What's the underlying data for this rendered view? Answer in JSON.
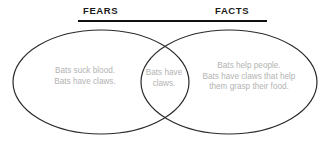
{
  "figure": {
    "name": "fears-vs-facts-venn-diagram",
    "background_color": "#ffffff"
  },
  "header": {
    "left_label": "FEARS",
    "right_label": "FACTS",
    "rule_color": "#111111",
    "label_color": "#1a1a1a"
  },
  "venn": {
    "outline_color": "#2b2b2b",
    "fill_color": "none",
    "stroke_width": 1.2,
    "left_circle": {
      "label": "FEARS",
      "text": "Bats suck blood.\nBats have claws."
    },
    "intersection": {
      "label": "BOTH",
      "text": "Bats have\nclaws."
    },
    "right_circle": {
      "label": "FACTS",
      "text": "Bats help people.\nBats have claws that help\nthem grasp their food."
    },
    "text_color": "#b3b3b3"
  }
}
